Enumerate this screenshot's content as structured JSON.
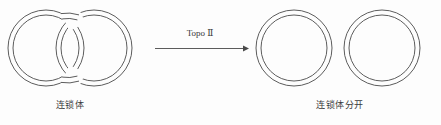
{
  "figure": {
    "background_color": "#fdfdfd",
    "stroke_color": "#4a4a4a",
    "width": 441,
    "height": 125
  },
  "diagram": {
    "type": "reaction-scheme",
    "left_side": {
      "caption": "连锁体",
      "structure": "two-interlocked-rings",
      "ring_count": 2,
      "rings": [
        {
          "name": "left-ring",
          "cx": 46,
          "cy": 48,
          "outer_r": 38,
          "inner_r": 33
        },
        {
          "name": "right-ring",
          "cx": 94,
          "cy": 48,
          "outer_r": 38,
          "inner_r": 33
        }
      ]
    },
    "arrow": {
      "label": "Topo Ⅱ",
      "direction": "right",
      "x_start": 155,
      "x_end": 248,
      "y": 48
    },
    "right_side": {
      "caption": "连锁体分开",
      "structure": "two-separate-rings",
      "ring_count": 2,
      "rings": [
        {
          "name": "separated-ring-1",
          "cx": 294,
          "cy": 48,
          "outer_r": 38,
          "inner_r": 33
        },
        {
          "name": "separated-ring-2",
          "cx": 382,
          "cy": 48,
          "outer_r": 38,
          "inner_r": 33
        }
      ]
    }
  }
}
